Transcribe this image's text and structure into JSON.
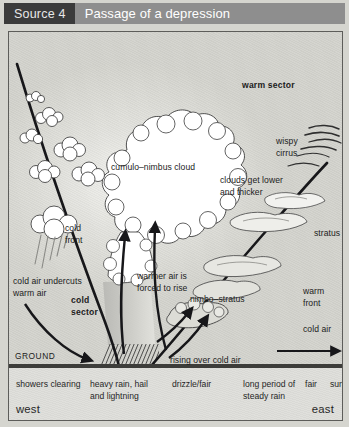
{
  "header": {
    "source_label": "Source 4",
    "title": "Passage of a depression"
  },
  "diagram": {
    "labels": {
      "cumulonimbus": "cumulo–nimbus cloud",
      "cold_front": "cold\nfront",
      "cold_air_undercuts": "cold air undercuts\nwarm air",
      "cold_sector": "cold\nsector",
      "ground": "GROUND",
      "warmer_air_rises": "warmer air is\nforced to rise",
      "rising_over_cold_air": "rising over cold air",
      "nimbostratus": "nimbo–stratus",
      "warm_sector": "warm sector",
      "wispy_cirrus": "wispy\ncirrus",
      "clouds_get_lower": "clouds get lower\nand thicker",
      "stratus": "stratus",
      "warm_front": "warm\nfront",
      "cold_air": "cold air"
    },
    "colors": {
      "front_line": "#17171a",
      "arrow": "#17171a",
      "cloud_outline": "#3c3c3c",
      "cloud_fill": "#ffffff",
      "sky": "#dcdcd6",
      "ground_line": "#3d3d3a",
      "header_bar": "#8e8e8e",
      "source_tab": "#3b3b3b"
    }
  },
  "outcomes": {
    "items": [
      "showers clearing",
      "heavy rain, hail\nand lightning",
      "drizzle/fair",
      "long period of\nsteady rain",
      "fair",
      "sunny"
    ],
    "west": "west",
    "east": "east"
  }
}
